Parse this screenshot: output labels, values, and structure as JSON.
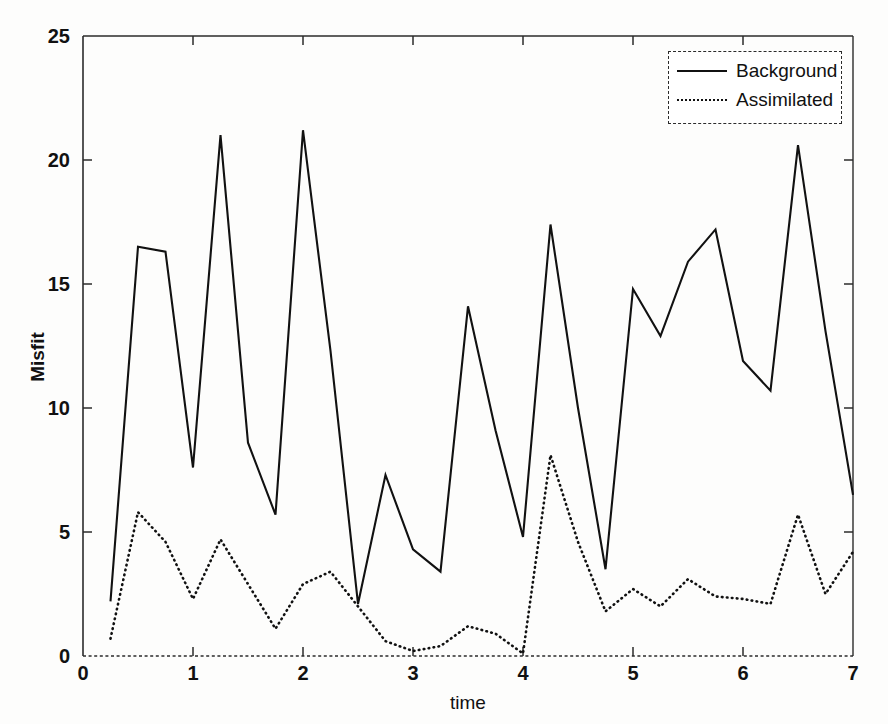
{
  "chart_data": {
    "type": "line",
    "title": "",
    "xlabel": "time",
    "ylabel": "Misfit",
    "xlim": [
      0,
      7
    ],
    "ylim": [
      0,
      25
    ],
    "xticks": [
      0,
      1,
      2,
      3,
      4,
      5,
      6,
      7
    ],
    "yticks": [
      0,
      5,
      10,
      15,
      20,
      25
    ],
    "grid": false,
    "legend_position": "top-right",
    "x": [
      0.25,
      0.5,
      0.75,
      1.0,
      1.25,
      1.5,
      1.75,
      2.0,
      2.25,
      2.5,
      2.75,
      3.0,
      3.25,
      3.5,
      3.75,
      4.0,
      4.25,
      4.5,
      4.75,
      5.0,
      5.25,
      5.5,
      5.75,
      6.0,
      6.25,
      6.5,
      6.75,
      7.0
    ],
    "series": [
      {
        "name": "Background",
        "style": "solid",
        "color": "#111111",
        "values": [
          2.2,
          16.5,
          16.3,
          7.6,
          21.0,
          8.6,
          5.7,
          21.2,
          12.3,
          2.1,
          7.3,
          4.3,
          3.4,
          14.1,
          9.1,
          4.8,
          17.4,
          10.0,
          3.5,
          14.8,
          12.9,
          15.9,
          17.2,
          11.9,
          10.7,
          20.6,
          13.1,
          6.5
        ]
      },
      {
        "name": "Assimilated",
        "style": "dotted",
        "color": "#111111",
        "values": [
          0.7,
          5.8,
          4.6,
          2.3,
          4.7,
          2.9,
          1.1,
          2.9,
          3.4,
          2.0,
          0.6,
          0.2,
          0.4,
          1.2,
          0.9,
          0.1,
          8.1,
          4.6,
          1.8,
          2.7,
          2.0,
          3.1,
          2.4,
          2.3,
          2.1,
          5.7,
          2.5,
          4.2
        ]
      }
    ]
  },
  "axes": {
    "x_tick_labels": [
      "0",
      "1",
      "2",
      "3",
      "4",
      "5",
      "6",
      "7"
    ],
    "y_tick_labels": [
      "0",
      "5",
      "10",
      "15",
      "20",
      "25"
    ],
    "x_title": "time",
    "y_title": "Misfit"
  },
  "legend": {
    "entries": [
      {
        "label": "Background",
        "style": "solid"
      },
      {
        "label": "Assimilated",
        "style": "dotted"
      }
    ]
  }
}
